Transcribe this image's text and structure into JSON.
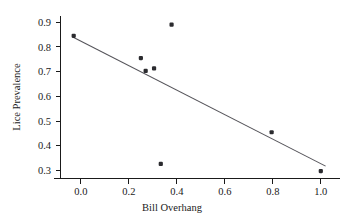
{
  "chart_data": {
    "type": "scatter",
    "title": "",
    "xlabel": "Bill Overhang",
    "ylabel": "Lice Prevalence",
    "xlim": [
      -0.085,
      1.08
    ],
    "ylim": [
      0.268,
      0.925
    ],
    "xticks": [
      0.0,
      0.2,
      0.4,
      0.6,
      0.8,
      1.0
    ],
    "xtick_labels": [
      "0.0",
      "0.2",
      "0.4",
      "0.6",
      "0.8",
      "1.0"
    ],
    "yticks": [
      0.3,
      0.4,
      0.5,
      0.6,
      0.7,
      0.8,
      0.9
    ],
    "ytick_labels": [
      "0.3",
      "0.4",
      "0.5",
      "0.6",
      "0.7",
      "0.8",
      "0.9"
    ],
    "grid": false,
    "legend": null,
    "point_color": "#2b2b2f",
    "line_color": "#55545a",
    "background_color": "#ffffff",
    "points": [
      {
        "x": -0.03,
        "y": 0.845
      },
      {
        "x": 0.25,
        "y": 0.755
      },
      {
        "x": 0.27,
        "y": 0.703
      },
      {
        "x": 0.305,
        "y": 0.713
      },
      {
        "x": 0.333,
        "y": 0.327
      },
      {
        "x": 0.378,
        "y": 0.89
      },
      {
        "x": 0.795,
        "y": 0.455
      },
      {
        "x": 1.0,
        "y": 0.298
      }
    ],
    "series": [
      {
        "name": "observations",
        "type": "scatter",
        "x": [
          -0.03,
          0.25,
          0.27,
          0.305,
          0.333,
          0.378,
          0.795,
          1.0
        ],
        "values": [
          0.845,
          0.755,
          0.703,
          0.713,
          0.327,
          0.89,
          0.455,
          0.298
        ]
      },
      {
        "name": "regression-line",
        "type": "line",
        "x": [
          -0.03,
          1.02
        ],
        "values": [
          0.838,
          0.318
        ]
      }
    ]
  },
  "axes": {
    "x_title": "Bill Overhang",
    "y_title": "Lice Prevalence"
  }
}
